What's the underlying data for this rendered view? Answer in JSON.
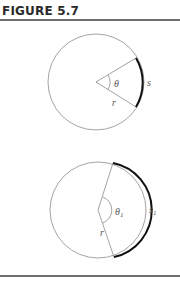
{
  "figure": {
    "title": "FIGURE 5.7"
  },
  "diagram_top": {
    "angle_label": "θ",
    "arc_label": "s",
    "radius_label": "r"
  },
  "diagram_bottom": {
    "angle_label": "θ",
    "angle_subscript": "1",
    "arc_label": "s",
    "arc_subscript": "1",
    "radius_label": "r"
  },
  "colors": {
    "circle": "#9a9a9a",
    "arc_highlight": "#111111",
    "rule": "#6e6e6e"
  }
}
